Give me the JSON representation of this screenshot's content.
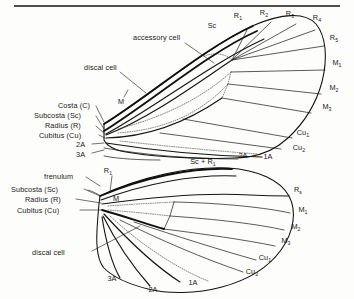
{
  "figure": {
    "top_rule": true,
    "wings": [
      {
        "name": "forewing",
        "label": "forewing"
      },
      {
        "name": "hindwing",
        "label": "hindwing"
      }
    ]
  },
  "colors": {
    "ink": "#111111",
    "vestigial": "#4a4a4a",
    "background": "#fdfdfb"
  },
  "forewing": {
    "left_labels": [
      {
        "id": "costa",
        "text": "Costa (C)",
        "x": 58,
        "y": 108
      },
      {
        "id": "subcosta",
        "text": "Subcosta (Sc)",
        "x": 42,
        "y": 118
      },
      {
        "id": "radius",
        "text": "Radius (R)",
        "x": 52,
        "y": 128
      },
      {
        "id": "cubitus",
        "text": "Cubitus (Cu)",
        "x": 47,
        "y": 137
      },
      {
        "id": "2a",
        "text": "2A",
        "x": 78,
        "y": 146
      },
      {
        "id": "3a",
        "text": "3A",
        "x": 78,
        "y": 156
      }
    ],
    "margin_labels": [
      {
        "id": "sc",
        "base": "Sc",
        "sub": "",
        "x": 212,
        "y": 27
      },
      {
        "id": "r1",
        "base": "R",
        "sub": "1",
        "x": 239,
        "y": 18
      },
      {
        "id": "r2",
        "base": "R",
        "sub": "2",
        "x": 265,
        "y": 15
      },
      {
        "id": "r3",
        "base": "R",
        "sub": "3",
        "x": 291,
        "y": 16
      },
      {
        "id": "r4",
        "base": "R",
        "sub": "4",
        "x": 317,
        "y": 20
      },
      {
        "id": "r5",
        "base": "R",
        "sub": "5",
        "x": 330,
        "y": 39
      },
      {
        "id": "m1",
        "base": "M",
        "sub": "1",
        "x": 333,
        "y": 64
      },
      {
        "id": "m2",
        "base": "M",
        "sub": "2",
        "x": 330,
        "y": 89
      },
      {
        "id": "m3",
        "base": "M",
        "sub": "3",
        "x": 324,
        "y": 107
      },
      {
        "id": "cu1",
        "base": "Cu",
        "sub": "1",
        "x": 300,
        "y": 134
      },
      {
        "id": "cu2",
        "base": "Cu",
        "sub": "2",
        "x": 296,
        "y": 148
      },
      {
        "id": "1a",
        "base": "1A",
        "sub": "",
        "x": 267,
        "y": 158
      },
      {
        "id": "2a_m",
        "base": "2A",
        "sub": "",
        "x": 241,
        "y": 157
      }
    ],
    "inner_labels": [
      {
        "id": "accessory-cell",
        "text": "accessory cell",
        "x": 135,
        "y": 40
      },
      {
        "id": "discal-cell",
        "text": "discal cell",
        "x": 84,
        "y": 69
      },
      {
        "id": "media",
        "text": "M",
        "x": 121,
        "y": 101
      }
    ],
    "vein_group_label": {
      "id": "sc-plus-r1",
      "base": "Sc + R",
      "sub": "1",
      "x": 198,
      "y": 163
    }
  },
  "hindwing": {
    "left_labels": [
      {
        "id": "frenulum",
        "text": "frenulum",
        "x": 49,
        "y": 178
      },
      {
        "id": "subcosta",
        "text": "Subcosta (Sc)",
        "x": 19,
        "y": 191
      },
      {
        "id": "radius",
        "text": "Radius (R)",
        "x": 33,
        "y": 201
      },
      {
        "id": "cubitus",
        "text": "Cubitus (Cu)",
        "x": 26,
        "y": 212
      }
    ],
    "inner_labels": [
      {
        "id": "r1",
        "base": "R",
        "sub": "1",
        "x": 105,
        "y": 172
      },
      {
        "id": "media",
        "base": "M",
        "sub": "",
        "x": 115,
        "y": 199
      },
      {
        "id": "discal-cell",
        "base": "discal cell",
        "sub": "",
        "x": 52,
        "y": 254
      }
    ],
    "margin_labels": [
      {
        "id": "rs",
        "base": "R",
        "sub": "s",
        "x": 296,
        "y": 191
      },
      {
        "id": "m1",
        "base": "M",
        "sub": "1",
        "x": 300,
        "y": 211
      },
      {
        "id": "m2",
        "base": "M",
        "sub": "2",
        "x": 293,
        "y": 227
      },
      {
        "id": "m3",
        "base": "M",
        "sub": "3",
        "x": 283,
        "y": 241
      },
      {
        "id": "cu1",
        "base": "Cu",
        "sub": "1",
        "x": 262,
        "y": 258
      },
      {
        "id": "cu2",
        "base": "Cu",
        "sub": "2",
        "x": 249,
        "y": 272
      },
      {
        "id": "1a",
        "base": "1A",
        "sub": "",
        "x": 191,
        "y": 283
      },
      {
        "id": "2a",
        "base": "2A",
        "sub": "",
        "x": 151,
        "y": 290
      },
      {
        "id": "3a",
        "base": "3A",
        "sub": "",
        "x": 110,
        "y": 279
      }
    ]
  }
}
